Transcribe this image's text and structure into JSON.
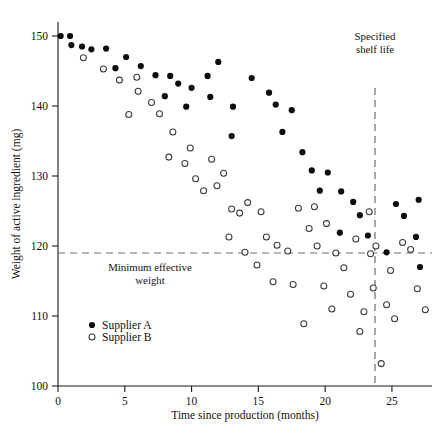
{
  "chart_data": {
    "type": "scatter",
    "title": "",
    "xlabel": "Time since production (months)",
    "ylabel": "Weight of active ingredient (mg)",
    "xlim": [
      0,
      28
    ],
    "ylim": [
      100,
      152
    ],
    "xticks": [
      0,
      5,
      10,
      15,
      20,
      25
    ],
    "yticks": [
      100,
      110,
      120,
      130,
      140,
      150
    ],
    "xtick_labels": [
      "0",
      "5",
      "10",
      "15",
      "20",
      "25"
    ],
    "ytick_labels": [
      "100",
      "110",
      "120",
      "130",
      "140",
      "150"
    ],
    "grid": false,
    "legend_position": "lower-left-inside",
    "annotations": [
      {
        "name": "specified-shelf-life",
        "text_line1": "Specified",
        "text_line2": "shelf life",
        "type": "vertical-reference-line",
        "x_value": 24,
        "style": "dashed"
      },
      {
        "name": "minimum-effective-weight",
        "text_line1": "Minimum effective",
        "text_line2": "weight",
        "type": "horizontal-reference-line",
        "y_value": 120,
        "style": "dashed"
      }
    ],
    "series": [
      {
        "name": "Supplier A",
        "marker": "filled-circle",
        "color": "#0d0d0d",
        "points": [
          [
            0.2,
            150.0
          ],
          [
            0.9,
            150.0
          ],
          [
            1.0,
            148.7
          ],
          [
            1.8,
            148.5
          ],
          [
            2.5,
            148.1
          ],
          [
            3.6,
            148.2
          ],
          [
            5.1,
            147.0
          ],
          [
            4.3,
            145.4
          ],
          [
            6.2,
            145.7
          ],
          [
            7.3,
            144.4
          ],
          [
            8.4,
            144.3
          ],
          [
            9.0,
            143.2
          ],
          [
            8.0,
            141.4
          ],
          [
            10.0,
            142.6
          ],
          [
            9.6,
            139.9
          ],
          [
            11.2,
            144.3
          ],
          [
            11.4,
            141.3
          ],
          [
            13.1,
            139.9
          ],
          [
            13.0,
            135.7
          ],
          [
            12.0,
            146.3
          ],
          [
            14.5,
            144.0
          ],
          [
            15.8,
            141.9
          ],
          [
            16.3,
            140.2
          ],
          [
            17.5,
            139.4
          ],
          [
            16.8,
            136.3
          ],
          [
            18.3,
            133.4
          ],
          [
            19.0,
            130.8
          ],
          [
            20.2,
            130.5
          ],
          [
            19.6,
            127.9
          ],
          [
            21.2,
            127.8
          ],
          [
            22.1,
            126.3
          ],
          [
            21.1,
            121.9
          ],
          [
            23.2,
            121.5
          ],
          [
            22.6,
            124.4
          ],
          [
            24.6,
            119.1
          ],
          [
            25.3,
            126.0
          ],
          [
            25.9,
            124.3
          ],
          [
            27.0,
            126.6
          ],
          [
            26.8,
            121.3
          ],
          [
            27.1,
            117.0
          ]
        ]
      },
      {
        "name": "Supplier B",
        "marker": "open-circle",
        "color": "#ffffff",
        "points": [
          [
            1.9,
            146.9
          ],
          [
            3.4,
            145.3
          ],
          [
            4.6,
            143.7
          ],
          [
            5.9,
            144.1
          ],
          [
            6.0,
            142.1
          ],
          [
            5.3,
            138.8
          ],
          [
            7.6,
            138.9
          ],
          [
            8.6,
            136.3
          ],
          [
            8.3,
            132.7
          ],
          [
            9.5,
            131.8
          ],
          [
            10.3,
            129.6
          ],
          [
            10.9,
            127.9
          ],
          [
            9.9,
            134.0
          ],
          [
            11.5,
            132.4
          ],
          [
            12.4,
            130.4
          ],
          [
            11.9,
            128.6
          ],
          [
            13.0,
            125.3
          ],
          [
            13.6,
            124.7
          ],
          [
            12.8,
            121.3
          ],
          [
            14.2,
            126.2
          ],
          [
            14.0,
            119.1
          ],
          [
            15.2,
            124.9
          ],
          [
            15.6,
            121.3
          ],
          [
            14.9,
            117.3
          ],
          [
            16.4,
            120.1
          ],
          [
            16.1,
            114.9
          ],
          [
            17.2,
            119.3
          ],
          [
            17.6,
            114.5
          ],
          [
            18.4,
            108.9
          ],
          [
            18.0,
            125.4
          ],
          [
            18.8,
            122.5
          ],
          [
            19.4,
            120.0
          ],
          [
            19.9,
            114.3
          ],
          [
            20.5,
            111.0
          ],
          [
            20.8,
            119.0
          ],
          [
            21.4,
            116.9
          ],
          [
            21.9,
            113.1
          ],
          [
            22.3,
            121.0
          ],
          [
            22.6,
            107.8
          ],
          [
            22.9,
            110.6
          ],
          [
            23.4,
            118.9
          ],
          [
            23.6,
            114.0
          ],
          [
            23.8,
            120.0
          ],
          [
            23.3,
            124.9
          ],
          [
            24.2,
            103.2
          ],
          [
            24.6,
            111.6
          ],
          [
            24.9,
            116.5
          ],
          [
            25.2,
            109.6
          ],
          [
            25.8,
            120.5
          ],
          [
            26.4,
            119.5
          ],
          [
            26.9,
            113.9
          ],
          [
            27.5,
            110.9
          ],
          [
            7.0,
            140.5
          ],
          [
            19.2,
            125.6
          ],
          [
            20.1,
            123.2
          ]
        ]
      }
    ]
  },
  "legend": {
    "entries": [
      {
        "label": "Supplier A",
        "marker": "filled-circle"
      },
      {
        "label": "Supplier B",
        "marker": "open-circle"
      }
    ]
  },
  "labels": {
    "y_axis_title": "Weight of active ingredient (mg)",
    "x_axis_title": "Time since production (months)",
    "shelf_life_line1": "Specified",
    "shelf_life_line2": "shelf life",
    "min_weight_line1": "Minimum effective",
    "min_weight_line2": "weight"
  },
  "colors": {
    "supplier_a": "#0d0d0d",
    "supplier_b_fill": "#ffffff",
    "supplier_b_stroke": "#3a3a3a",
    "axis": "#1a1a1a",
    "dashed": "#6e6e6e",
    "background": "#ffffff"
  }
}
